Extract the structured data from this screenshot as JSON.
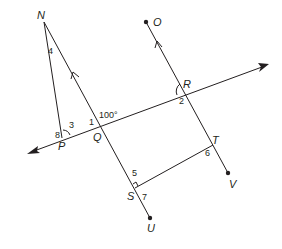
{
  "figure": {
    "type": "geometry-diagram",
    "line_color": "#231f20",
    "points": {
      "N": {
        "label": "N",
        "x": 44,
        "y": 22
      },
      "O": {
        "label": "O",
        "x": 146,
        "y": 22
      },
      "R": {
        "label": "R",
        "x": 185,
        "y": 92
      },
      "Q": {
        "label": "Q",
        "x": 100,
        "y": 115
      },
      "P": {
        "label": "P",
        "x": 62,
        "y": 138
      },
      "T": {
        "label": "T",
        "x": 213,
        "y": 145
      },
      "S": {
        "label": "S",
        "x": 135,
        "y": 188
      },
      "U": {
        "label": "U",
        "x": 150,
        "y": 218
      },
      "V": {
        "label": "V",
        "x": 228,
        "y": 173
      }
    },
    "angle_labels": {
      "a1": "1",
      "a2": "2",
      "a3": "3",
      "a4": "4",
      "a5": "5",
      "a6": "6",
      "a7": "7",
      "a8": "8",
      "given": "100°"
    }
  }
}
